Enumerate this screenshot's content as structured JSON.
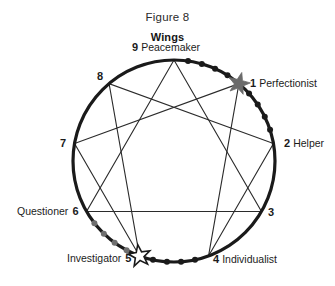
{
  "figure": {
    "title": "Figure 8",
    "subtitle": "Wings"
  },
  "colors": {
    "circle_stroke": "#1a1a1a",
    "inner_line": "#2b2b2b",
    "dot_dark": "#1a1a1a",
    "dot_gray": "#6f6f6f",
    "star_filled": "#6b6b6b",
    "star_outline_fill": "#ffffff",
    "star_outline_stroke": "#1a1a1a",
    "text": "#1b1b1b",
    "background": "#ffffff"
  },
  "chart_data": {
    "type": "diagram",
    "title": "Figure 8",
    "subtitle": "Wings",
    "geometry": {
      "center_x": 174,
      "center_y": 161,
      "radius": 101,
      "point_count": 9,
      "top_point": 9
    },
    "points": [
      {
        "number": "9",
        "name": "Peacemaker",
        "angle_deg": 270,
        "label_side": "top",
        "marker": "none"
      },
      {
        "number": "1",
        "name": "Perfectionist",
        "angle_deg": 310,
        "label_side": "right",
        "marker": "star-filled"
      },
      {
        "number": "2",
        "name": "Helper",
        "angle_deg": 350,
        "label_side": "right",
        "marker": "none"
      },
      {
        "number": "3",
        "name": "",
        "angle_deg": 30,
        "label_side": "right",
        "marker": "none"
      },
      {
        "number": "4",
        "name": "Individualist",
        "angle_deg": 70,
        "label_side": "right",
        "marker": "none"
      },
      {
        "number": "5",
        "name": "Investigator",
        "angle_deg": 110,
        "label_side": "left",
        "marker": "star-outline"
      },
      {
        "number": "6",
        "name": "Questioner",
        "angle_deg": 150,
        "label_side": "left",
        "marker": "none"
      },
      {
        "number": "7",
        "name": "",
        "angle_deg": 190,
        "label_side": "left",
        "marker": "none"
      },
      {
        "number": "8",
        "name": "",
        "angle_deg": 230,
        "label_side": "left",
        "marker": "none"
      }
    ],
    "inner_lines": {
      "hexad_sequence": [
        "1",
        "4",
        "2",
        "8",
        "5",
        "7",
        "1"
      ],
      "triangle_sequence": [
        "9",
        "3",
        "6",
        "9"
      ]
    },
    "wing_arcs": [
      {
        "from": "9",
        "to": "1",
        "shade": "dark",
        "dot_count": 4
      },
      {
        "from": "1",
        "to": "2",
        "shade": "dark",
        "dot_count": 4
      },
      {
        "from": "5",
        "to": "4",
        "shade": "dark",
        "dot_count": 4
      },
      {
        "from": "6",
        "to": "5",
        "shade": "gray",
        "dot_count": 4
      }
    ]
  }
}
